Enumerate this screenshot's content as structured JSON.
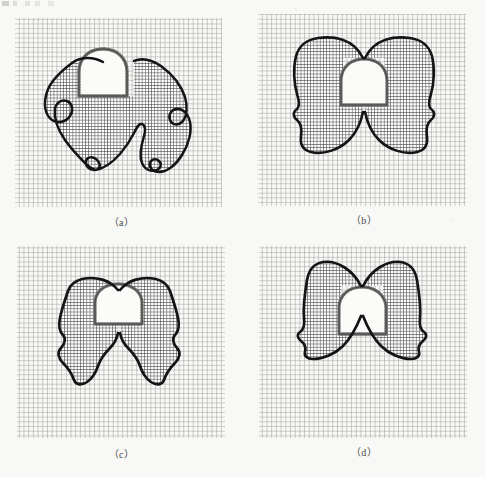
{
  "figure": {
    "background_color": "#f8f8f6",
    "ink_color": "#1a1a1a",
    "grid_color": "#9a9a99",
    "grid_color_dense": "#5d5d5c",
    "stipple_color": "#6e6e6d",
    "inner_fill_color": "#fbfbf9",
    "panel_count": 4,
    "layout": "2x2"
  },
  "panels": [
    {
      "id": "a",
      "caption": "（a）",
      "caption_plain": "(a)",
      "grid": {
        "x": 15,
        "y": 18,
        "width": 207,
        "height": 189,
        "cell_size": 4.7,
        "dense_cell_size": 3.2
      },
      "shape_name": "five-lobed-splayed-contour",
      "inner_shape_name": "bell-arch-cavity",
      "contour_path": "M 103,62 C 92,56 80,57 72,63 C 60,72 50,82 47,92 C 43,104 45,115 52,120 C 58,124 66,122 70,116 C 74,110 72,103 67,101 C 61,99 56,103 55,109 C 54,118 58,130 65,140 C 72,150 80,158 85,163 C 90,168 95,171 98,169 C 101,167 100,162 96,159 C 92,156 87,157 86,161 C 85,166 89,170 95,170 C 103,169 112,163 120,154 C 126,147 131,139 134,133 C 137,127 139,123 142,124 C 145,125 146,130 144,136 C 141,146 139,156 142,163 C 145,170 151,172 157,170 C 161,168 162,164 159,161 C 156,158 151,159 150,163 C 149,168 153,172 159,172 C 167,172 176,165 182,155 C 189,144 192,131 190,122 C 188,113 182,108 176,109 C 171,110 168,115 170,120 C 172,125 178,126 182,122 C 187,117 188,107 185,97 C 181,85 172,74 161,66 C 152,60 142,57 133,60 L 133,93 L 103,93 Z",
      "inner_path": "M 80,96 L 80,69 C 80,58 88,50 100,50 C 112,50 120,58 120,69 L 120,96 Z",
      "inner_rect": {
        "x": 78,
        "y": 47,
        "width": 65,
        "height": 50
      }
    },
    {
      "id": "b",
      "caption": "（b）",
      "caption_plain": "(b)",
      "grid": {
        "x": 258,
        "y": 14,
        "width": 208,
        "height": 192,
        "cell_size": 4.7,
        "dense_cell_size": 3.3
      },
      "shape_name": "two-lobed-bow-contour-wide",
      "inner_shape_name": "bell-arch-cavity"
    },
    {
      "id": "c",
      "caption": "（c）",
      "caption_plain": "(c)",
      "grid": {
        "x": 17,
        "y": 246,
        "width": 208,
        "height": 192,
        "cell_size": 4.7,
        "dense_cell_size": 3.3
      },
      "shape_name": "two-lobed-bow-contour-tall",
      "inner_shape_name": "bell-arch-cavity"
    },
    {
      "id": "d",
      "caption": "（d）",
      "caption_plain": "(d)",
      "grid": {
        "x": 259,
        "y": 246,
        "width": 208,
        "height": 192,
        "cell_size": 4.7,
        "dense_cell_size": 3.3
      },
      "shape_name": "two-lobed-bow-contour-angular",
      "inner_shape_name": "bell-arch-cavity"
    }
  ]
}
